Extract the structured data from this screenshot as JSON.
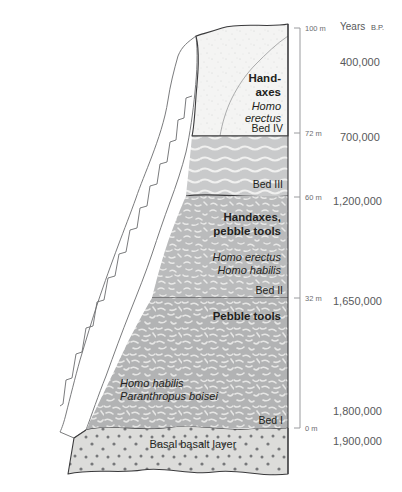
{
  "figure": {
    "axis": {
      "header_main": "Years",
      "header_smallcaps": "B.P.",
      "depth_unit": "m",
      "ticks": [
        {
          "value": "100",
          "label": "100 m",
          "y": 28
        },
        {
          "value": "72",
          "label": "72 m",
          "y": 133
        },
        {
          "value": "60",
          "label": "60 m",
          "y": 197
        },
        {
          "value": "32",
          "label": "32 m",
          "y": 298
        },
        {
          "value": "0",
          "label": "0 m",
          "y": 428
        }
      ],
      "years": [
        {
          "label": "400,000",
          "y": 62
        },
        {
          "label": "700,000",
          "y": 137
        },
        {
          "label": "1,200,000",
          "y": 201
        },
        {
          "label": "1,650,000",
          "y": 301
        },
        {
          "label": "1,800,000",
          "y": 411
        },
        {
          "label": "1,900,000",
          "y": 441
        }
      ]
    },
    "beds": [
      {
        "id": "bed-4",
        "name": "Bed IV",
        "bed_label": "Bed IV",
        "fill": "#f4f4f3",
        "texture": "fine-speckle",
        "labels": [
          {
            "text": "Hand-",
            "style": "bold",
            "x": 266,
            "y": 82
          },
          {
            "text": "axes",
            "style": "bold",
            "x": 266,
            "y": 95
          },
          {
            "text": "Homo",
            "style": "italic",
            "x": 266,
            "y": 109
          },
          {
            "text": "erectus",
            "style": "italic",
            "x": 266,
            "y": 121
          }
        ]
      },
      {
        "id": "bed-3",
        "name": "Bed III",
        "bed_label": "Bed III",
        "fill": "#c9cacb",
        "texture": "wavy-lines",
        "labels": []
      },
      {
        "id": "bed-2",
        "name": "Bed II",
        "bed_label": "Bed II",
        "fill": "#b9babb",
        "texture": "mottled",
        "labels": [
          {
            "text": "Handaxes,",
            "style": "bold",
            "x": 230,
            "y": 217
          },
          {
            "text": "pebble tools",
            "style": "bold",
            "x": 230,
            "y": 231
          },
          {
            "text": "Homo erectus",
            "style": "italic",
            "x": 230,
            "y": 258
          },
          {
            "text": "Homo habilis",
            "style": "italic",
            "x": 230,
            "y": 271
          }
        ]
      },
      {
        "id": "bed-1",
        "name": "Bed I",
        "bed_label": "Bed I",
        "fill": "#b3b4b5",
        "texture": "mottled",
        "labels": [
          {
            "text": "Pebble tools",
            "style": "bold",
            "x": 240,
            "y": 316
          },
          {
            "text": "Homo habilis",
            "style": "italic",
            "x": 185,
            "y": 383
          },
          {
            "text": "Paranthropus boisei",
            "style": "italic",
            "x": 185,
            "y": 396
          }
        ]
      },
      {
        "id": "basalt",
        "name": "Basal basalt layer",
        "bed_label": "",
        "fill": "#dcdcda",
        "texture": "dots",
        "labels": [
          {
            "text": "Basal basalt layer",
            "style": "plain",
            "x": 193,
            "y": 444
          }
        ]
      }
    ],
    "bed_labels_right": [
      {
        "text": "Bed IV",
        "x": 281,
        "y": 131
      },
      {
        "text": "Bed III",
        "x": 281,
        "y": 185
      },
      {
        "text": "Bed II",
        "x": 281,
        "y": 292
      },
      {
        "text": "Bed I",
        "x": 281,
        "y": 421
      }
    ],
    "colors": {
      "outline": "#3a3a3c",
      "axis": "#9a9b9e",
      "text": "#231f20",
      "axis_text": "#58595b",
      "slope_fill": "#ebebe9",
      "background": "#ffffff"
    }
  }
}
